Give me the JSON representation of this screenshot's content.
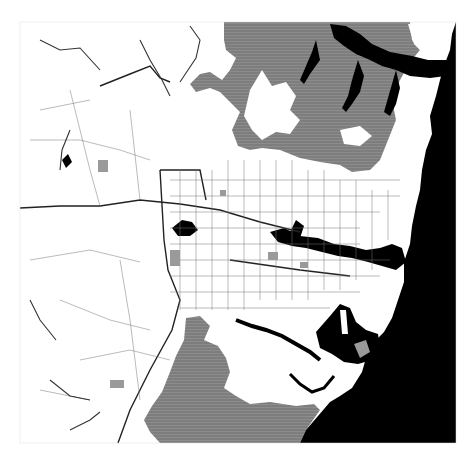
{
  "map": {
    "title": "Regional map (greyscale) — urban area with bushland, harbour and ocean",
    "colors": {
      "background": "#ffffff",
      "land": "#ffffff",
      "bushland": "#8a8a8a",
      "water": "#000000",
      "roads": "#555555",
      "major_roads": "#222222",
      "parks": "#9a9a9a"
    },
    "legend_visible": false,
    "labels_legible": false,
    "regions": [
      {
        "name": "northern-bushland",
        "fill": "bushland"
      },
      {
        "name": "southern-bushland",
        "fill": "bushland"
      },
      {
        "name": "ocean",
        "fill": "water"
      },
      {
        "name": "harbour",
        "fill": "water"
      },
      {
        "name": "bay",
        "fill": "water"
      },
      {
        "name": "river-estuary-north",
        "fill": "water"
      }
    ]
  }
}
